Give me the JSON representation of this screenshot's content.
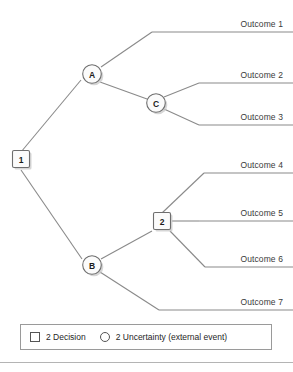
{
  "diagram": {
    "type": "decision-tree",
    "nodes": [
      {
        "id": "1",
        "label": "1",
        "kind": "decision",
        "shape": "square",
        "x": 21,
        "y": 160
      },
      {
        "id": "A",
        "label": "A",
        "kind": "uncertainty",
        "shape": "circle",
        "x": 92,
        "y": 74
      },
      {
        "id": "C",
        "label": "C",
        "kind": "uncertainty",
        "shape": "circle",
        "x": 156,
        "y": 103
      },
      {
        "id": "B",
        "label": "B",
        "kind": "uncertainty",
        "shape": "circle",
        "x": 92,
        "y": 265
      },
      {
        "id": "2",
        "label": "2",
        "kind": "decision",
        "shape": "square",
        "x": 162,
        "y": 222
      }
    ],
    "outcomes": [
      {
        "id": "outcome-1",
        "label": "Outcome 1",
        "rule_y": 32,
        "label_right": 10,
        "label_y": 19,
        "from": "A"
      },
      {
        "id": "outcome-2",
        "label": "Outcome 2",
        "rule_y": 83,
        "label_right": 10,
        "label_y": 70,
        "from": "C"
      },
      {
        "id": "outcome-3",
        "label": "Outcome 3",
        "rule_y": 125,
        "label_right": 10,
        "label_y": 112,
        "from": "C"
      },
      {
        "id": "outcome-4",
        "label": "Outcome 4",
        "rule_y": 173,
        "label_right": 10,
        "label_y": 160,
        "from": "2"
      },
      {
        "id": "outcome-5",
        "label": "Outcome 5",
        "rule_y": 221,
        "label_right": 10,
        "label_y": 208,
        "from": "2"
      },
      {
        "id": "outcome-6",
        "label": "Outcome 6",
        "rule_y": 267,
        "label_right": 10,
        "label_y": 254,
        "from": "2"
      },
      {
        "id": "outcome-7",
        "label": "Outcome 7",
        "rule_y": 310,
        "label_right": 10,
        "label_y": 297,
        "from": "B"
      }
    ],
    "colors": {
      "line": "#8a8a8a",
      "node_stroke": "#6e6e6e",
      "node_fill": "#fbfbfb",
      "text": "#3a3a3a",
      "background": "#ffffff",
      "legend_border": "#9a9a9a"
    }
  },
  "legend": {
    "decision": {
      "symbol": "square",
      "text": "2 Decision"
    },
    "uncertainty": {
      "symbol": "circle",
      "text": "2 Uncertainty (external event)"
    }
  }
}
